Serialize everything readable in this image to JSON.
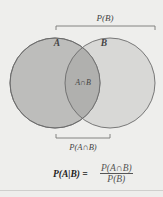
{
  "diagram": {
    "set_a_label": "A",
    "set_b_label": "B",
    "intersection_label": "A∩B",
    "top_bracket_label": "P(B)",
    "bottom_bracket_label": "P(A∩B)",
    "formula": {
      "lhs": "P(A|B) =",
      "numerator": "P(A∩B)",
      "denominator": "P(B)"
    },
    "colors": {
      "background": "#eeeeec",
      "circle_a_fill": "#bdbdbb",
      "circle_b_fill": "#d8d8d6",
      "intersection_fill": "#b0b0ae",
      "stroke": "#6b6b6b",
      "bracket": "#777777"
    }
  }
}
